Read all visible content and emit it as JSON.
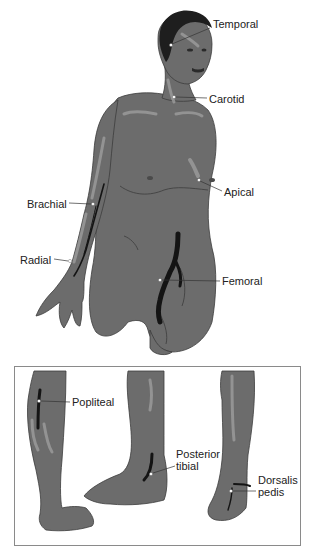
{
  "diagram": {
    "colors": {
      "skin": "#6c6c6c",
      "skin_highlight": "#9a9a9a",
      "skin_outline": "#3c3c3c",
      "hair": "#1e1e1e",
      "artery": "#141414",
      "pulse_dot": "#ffffff",
      "leader_line": "#333333",
      "label_text": "#222222",
      "inset_border": "#8a8a8a"
    },
    "labels": {
      "temporal": "Temporal",
      "carotid": "Carotid",
      "apical": "Apical",
      "brachial": "Brachial",
      "radial": "Radial",
      "femoral": "Femoral",
      "popliteal": "Popliteal",
      "posterior_tibial": "Posterior\ntibial",
      "dorsalis_pedis": "Dorsalis\npedis"
    }
  }
}
